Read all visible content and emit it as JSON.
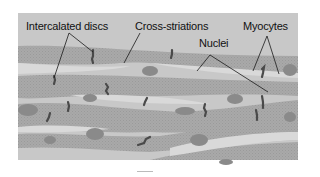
{
  "diagram": {
    "labels": {
      "intercalated_discs": "Intercalated discs",
      "cross_striations": "Cross-striations",
      "nuclei": "Nuclei",
      "myocytes": "Myocytes"
    },
    "colors": {
      "background_panel": "#c8c8c8",
      "myocyte_fill": "#a9a9a9",
      "gap_fill": "#d9d9d9",
      "nucleus_fill": "#8a8a8a",
      "disc_stroke": "#4a4a4a",
      "leader_line": "#1a1a1a"
    }
  }
}
